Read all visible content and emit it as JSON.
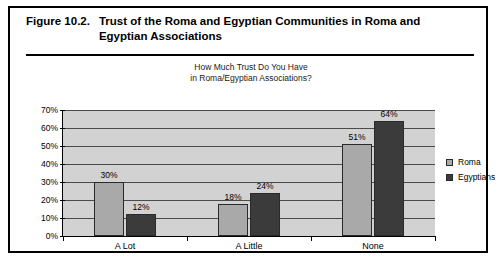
{
  "figure": {
    "number": "Figure 10.2.",
    "caption": "Trust of the Roma and Egyptian Communities in Roma and Egyptian Associations"
  },
  "legend": {
    "position": "right",
    "entries": [
      {
        "label": "Roma",
        "color": "#a9a9a9"
      },
      {
        "label": "Egyptians",
        "color": "#3b3b3b"
      }
    ]
  },
  "chart_data": {
    "type": "bar",
    "title": "How Much Trust Do You Have in Roma/Egyptian Associations?",
    "title_line1": "How Much Trust Do You Have",
    "title_line2": "in Roma/Egyptian Associations?",
    "xlabel": "",
    "ylabel": "",
    "ylim": [
      0,
      70
    ],
    "ytick_labels": [
      "70%",
      "60%",
      "50%",
      "40%",
      "30%",
      "20%",
      "10%",
      "0%"
    ],
    "ytick_values": [
      70,
      60,
      50,
      40,
      30,
      20,
      10,
      0
    ],
    "grid": true,
    "categories": [
      "A Lot",
      "A Little",
      "None"
    ],
    "series": [
      {
        "name": "Roma",
        "color": "#a9a9a9",
        "values": [
          30,
          18,
          51
        ],
        "labels": [
          "30%",
          "18%",
          "51%"
        ]
      },
      {
        "name": "Egyptians",
        "color": "#3b3b3b",
        "values": [
          12,
          24,
          64
        ],
        "labels": [
          "12%",
          "24%",
          "64%"
        ]
      }
    ]
  }
}
